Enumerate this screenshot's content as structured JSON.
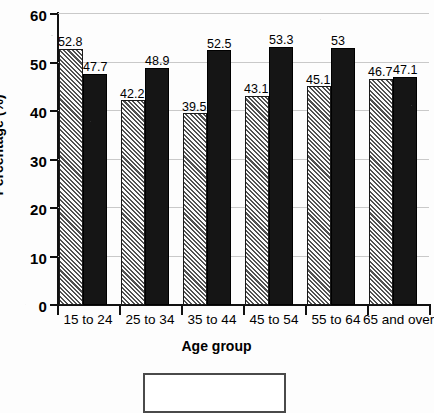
{
  "chart_data": {
    "type": "bar",
    "title": "",
    "subtitle": "",
    "xlabel": "Age group",
    "ylabel": "Percentage (%)",
    "categories": [
      "15 to 24",
      "25 to 34",
      "35 to 44",
      "45 to 54",
      "55 to 64",
      "65 and over"
    ],
    "series": [
      {
        "name": "series-1",
        "style": "hatched-gray",
        "color": "#b9b9b9",
        "values": [
          52.8,
          42.2,
          39.5,
          43.1,
          45.1,
          46.7
        ],
        "labels": [
          "52.8",
          "42.2",
          "39.5",
          "43.1",
          "45.1",
          "46.7"
        ]
      },
      {
        "name": "series-2",
        "style": "solid-black",
        "color": "#151515",
        "values": [
          47.7,
          48.9,
          52.5,
          53.3,
          53.0,
          47.1
        ],
        "labels": [
          "47.7",
          "48.9",
          "52.5",
          "53.3",
          "53",
          "47.1"
        ]
      }
    ],
    "ylim": [
      0,
      60
    ],
    "ytick_values": [
      0,
      10,
      20,
      30,
      40,
      50,
      60
    ],
    "ytick_labels": [
      "0",
      "10",
      "20",
      "30",
      "40",
      "50",
      "60"
    ],
    "grid": true,
    "grid_axis": "y",
    "legend_position": "bottom",
    "legend_entries": []
  },
  "axes": {
    "y_title": "Percentage (%)",
    "x_title": "Age group"
  }
}
